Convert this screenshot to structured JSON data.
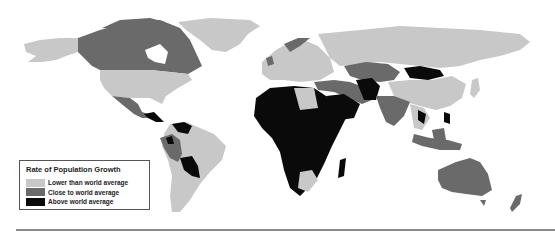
{
  "legend": {
    "title": "Rate of Population Growth",
    "items": [
      {
        "label": "Lower than world average",
        "color": "#c8c8c8"
      },
      {
        "label": "Close to world average",
        "color": "#6a6a6a"
      },
      {
        "label": "Above world average",
        "color": "#0a0a0a"
      }
    ]
  },
  "colors": {
    "low": "#c8c8c8",
    "mid": "#6a6a6a",
    "high": "#0a0a0a",
    "background": "#ffffff"
  }
}
